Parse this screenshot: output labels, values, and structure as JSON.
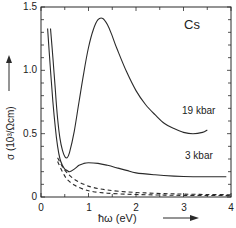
{
  "chart_data": {
    "type": "line",
    "title": "Cs",
    "xlabel": "ħω (eV)",
    "ylabel": "σ (10³/Ωcm)",
    "xlim": [
      0,
      4
    ],
    "ylim": [
      0,
      1.5
    ],
    "x_ticks": [
      "0",
      "1",
      "2",
      "3",
      "4"
    ],
    "y_ticks": [
      "0",
      "0.5",
      "1.0",
      "1.5"
    ],
    "grid": false,
    "legend": "inline curve labels",
    "series": [
      {
        "name": "19 kbar",
        "style": "solid",
        "x": [
          0.2,
          0.25,
          0.3,
          0.35,
          0.4,
          0.45,
          0.5,
          0.55,
          0.6,
          0.7,
          0.8,
          0.9,
          1.0,
          1.1,
          1.2,
          1.3,
          1.4,
          1.5,
          1.6,
          1.8,
          2.0,
          2.2,
          2.4,
          2.6,
          2.8,
          3.0,
          3.2,
          3.4,
          3.5
        ],
        "y": [
          1.33,
          1.1,
          0.85,
          0.62,
          0.46,
          0.37,
          0.32,
          0.31,
          0.35,
          0.52,
          0.75,
          0.98,
          1.18,
          1.32,
          1.4,
          1.41,
          1.36,
          1.27,
          1.17,
          0.99,
          0.84,
          0.73,
          0.65,
          0.58,
          0.54,
          0.51,
          0.5,
          0.51,
          0.53
        ]
      },
      {
        "name": "3 kbar",
        "style": "solid",
        "x": [
          0.14,
          0.2,
          0.25,
          0.3,
          0.35,
          0.4,
          0.45,
          0.5,
          0.55,
          0.6,
          0.7,
          0.8,
          0.9,
          1.0,
          1.2,
          1.4,
          1.6,
          1.8,
          2.0,
          2.4,
          2.8,
          3.2,
          3.6,
          3.9
        ],
        "y": [
          1.33,
          1.0,
          0.75,
          0.55,
          0.4,
          0.3,
          0.25,
          0.22,
          0.21,
          0.2,
          0.22,
          0.25,
          0.265,
          0.27,
          0.265,
          0.25,
          0.23,
          0.21,
          0.19,
          0.175,
          0.165,
          0.16,
          0.16,
          0.16
        ]
      },
      {
        "name": "Drude fit 19 kbar",
        "style": "dashed",
        "x": [
          0.35,
          0.45,
          0.55,
          0.7,
          0.9,
          1.1,
          1.4,
          1.8,
          2.2,
          2.6,
          3.0,
          3.5,
          4.0
        ],
        "y": [
          0.31,
          0.24,
          0.19,
          0.14,
          0.1,
          0.075,
          0.055,
          0.04,
          0.032,
          0.027,
          0.023,
          0.02,
          0.018
        ]
      },
      {
        "name": "Drude fit 3 kbar",
        "style": "dashed",
        "x": [
          0.35,
          0.45,
          0.55,
          0.7,
          0.9,
          1.1,
          1.4,
          1.8,
          2.2,
          2.6,
          3.0,
          3.5,
          4.0
        ],
        "y": [
          0.28,
          0.2,
          0.14,
          0.095,
          0.06,
          0.042,
          0.03,
          0.022,
          0.018,
          0.015,
          0.013,
          0.012,
          0.011
        ]
      }
    ],
    "annotations": [
      {
        "text": "19 kbar",
        "x": 2.85,
        "y": 0.63
      },
      {
        "text": "3 kbar",
        "x": 2.9,
        "y": 0.27
      },
      {
        "text": "Cs",
        "x": 3.05,
        "y": 1.22
      }
    ]
  },
  "labels": {
    "title": "Cs",
    "curve_19": "19 kbar",
    "curve_3": "3 kbar",
    "xlabel": "ħω (eV)",
    "ylabel": "σ (10³/Ωcm)",
    "xt0": "0",
    "xt1": "1",
    "xt2": "2",
    "xt3": "3",
    "xt4": "4",
    "yt0": "0",
    "yt05": "0.5",
    "yt10": "1.0",
    "yt15": "1.5"
  },
  "colors": {
    "line": "#2a2a2a",
    "background": "#ffffff"
  }
}
